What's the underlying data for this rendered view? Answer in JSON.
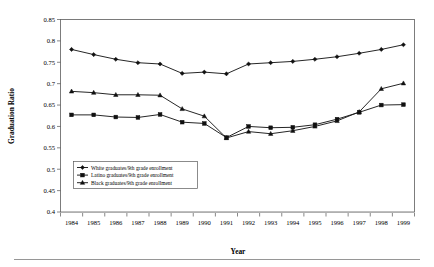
{
  "chart_data": {
    "type": "line",
    "title": "",
    "xlabel": "Year",
    "ylabel": "Graduation Ratio",
    "grid": "horizontal",
    "legend_position": "inside-lower-left",
    "x": [
      1984,
      1985,
      1986,
      1987,
      1988,
      1989,
      1990,
      1991,
      1992,
      1993,
      1994,
      1995,
      1996,
      1997,
      1998,
      1999
    ],
    "xtick_labels": [
      "1984",
      "1985",
      "1986",
      "1987",
      "1988",
      "1989",
      "1990",
      "1991",
      "1992",
      "1993",
      "1994",
      "1995",
      "1996",
      "1997",
      "1998",
      "1999"
    ],
    "ylim": [
      0.4,
      0.85
    ],
    "ytick_labels": [
      "0.4",
      "0.45",
      "0.5",
      "0.55",
      "0.6",
      "0.65",
      "0.7",
      "0.75",
      "0.8",
      "0.85"
    ],
    "ytick_values": [
      0.4,
      0.45,
      0.5,
      0.55,
      0.6,
      0.65,
      0.7,
      0.75,
      0.8,
      0.85
    ],
    "series": [
      {
        "name": "White graduates/9th grade enrollment",
        "marker": "diamond",
        "values": [
          0.78,
          0.768,
          0.757,
          0.749,
          0.746,
          0.724,
          0.727,
          0.723,
          0.746,
          0.749,
          0.752,
          0.757,
          0.763,
          0.771,
          0.78,
          0.791
        ]
      },
      {
        "name": "Latino graduates/9th grade enrollment",
        "marker": "square",
        "values": [
          0.627,
          0.627,
          0.622,
          0.621,
          0.628,
          0.61,
          0.607,
          0.574,
          0.6,
          0.597,
          0.598,
          0.604,
          0.617,
          0.633,
          0.65,
          0.651
        ]
      },
      {
        "name": "Black graduates/9th grade enrollment",
        "marker": "triangle",
        "values": [
          0.682,
          0.679,
          0.674,
          0.674,
          0.673,
          0.641,
          0.624,
          0.573,
          0.588,
          0.583,
          0.59,
          0.6,
          0.613,
          0.634,
          0.688,
          0.701
        ]
      }
    ]
  }
}
